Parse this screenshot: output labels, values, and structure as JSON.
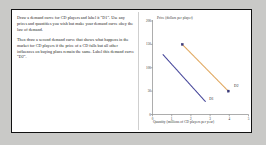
{
  "worksheet": {
    "instructions": [
      "Draw a demand curve for CD players and label it \"D1\". Use any prices and quantities you wish but make your demand curve obey the law of demand.",
      "Then draw a second demand curve that shows what happens in the market for CD players if the price of a CD falls but all other influences on buying plans remain the same. Label this demand curve \"D2\"."
    ]
  },
  "chart_data": {
    "type": "line",
    "title": "",
    "ylabel": "Price (dollars per player)",
    "xlabel": "Quantity (millions of CD players per year)",
    "ylim": [
      0,
      200
    ],
    "xlim": [
      0,
      5
    ],
    "yticks": [
      0,
      50,
      100,
      150,
      200
    ],
    "ytick_labels": [
      "0",
      "50",
      "100",
      "150",
      "200"
    ],
    "xticks": [
      0,
      1,
      2,
      3,
      4,
      5
    ],
    "xtick_labels": [
      "0",
      "1",
      "2",
      "3",
      "4",
      "5"
    ],
    "grid": false,
    "legend": "none",
    "series": [
      {
        "name": "D1",
        "label": "D1",
        "color": "#4a4a9c",
        "x": [
          0.55,
          2.75
        ],
        "y": [
          128,
          28
        ],
        "markers": false
      },
      {
        "name": "D2",
        "label": "D2",
        "color": "#e0a860",
        "x": [
          1.55,
          3.95
        ],
        "y": [
          150,
          50
        ],
        "markers": true
      }
    ],
    "annotations": [
      {
        "text": "D1",
        "x": 2.95,
        "y": 33
      },
      {
        "text": "D2",
        "x": 4.25,
        "y": 62
      }
    ]
  }
}
